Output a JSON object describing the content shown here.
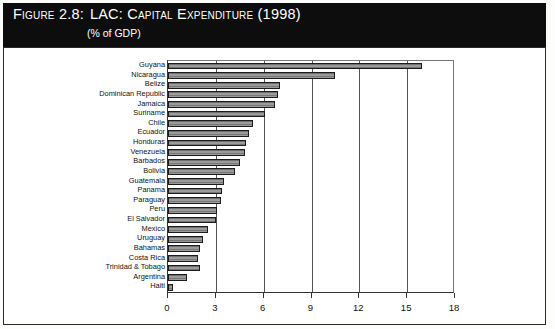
{
  "figure": {
    "label": "Figure 2.8:",
    "title": "LAC: Capital Expenditure (1998)",
    "subtitle": "(% of GDP)"
  },
  "colors": {
    "title_background": "#0d0d0d",
    "title_text": "#ffffff",
    "bar_fill": "#8a8a8a",
    "bar_border": "#1c1c1c",
    "axis": "#333333",
    "gridline": "#555555",
    "page_background": "#ffffff"
  },
  "chart_data": {
    "type": "bar",
    "orientation": "horizontal",
    "title": "LAC: Capital Expenditure (1998)",
    "subtitle": "(% of GDP)",
    "xlabel": "",
    "ylabel": "",
    "xlim": [
      0,
      18
    ],
    "xticks": [
      0,
      3,
      6,
      9,
      12,
      15,
      18
    ],
    "grid": true,
    "legend": false,
    "categories": [
      "Guyana",
      "Nicaragua",
      "Belize",
      "Dominican Republic",
      "Jamaica",
      "Suriname",
      "Chile",
      "Ecuador",
      "Honduras",
      "Venezuela",
      "Barbados",
      "Bolivia",
      "Guatemala",
      "Panama",
      "Paraguay",
      "Peru",
      "El Salvador",
      "Mexico",
      "Uruguay",
      "Bahamas",
      "Costa Rica",
      "Trinidad & Tobago",
      "Argentina",
      "Haiti"
    ],
    "values": [
      15.9,
      10.5,
      7.0,
      6.9,
      6.7,
      6.1,
      5.3,
      5.1,
      4.9,
      4.8,
      4.5,
      4.2,
      3.5,
      3.4,
      3.3,
      3.1,
      3.0,
      2.5,
      2.2,
      2.0,
      1.9,
      2.0,
      1.2,
      0.3
    ]
  }
}
